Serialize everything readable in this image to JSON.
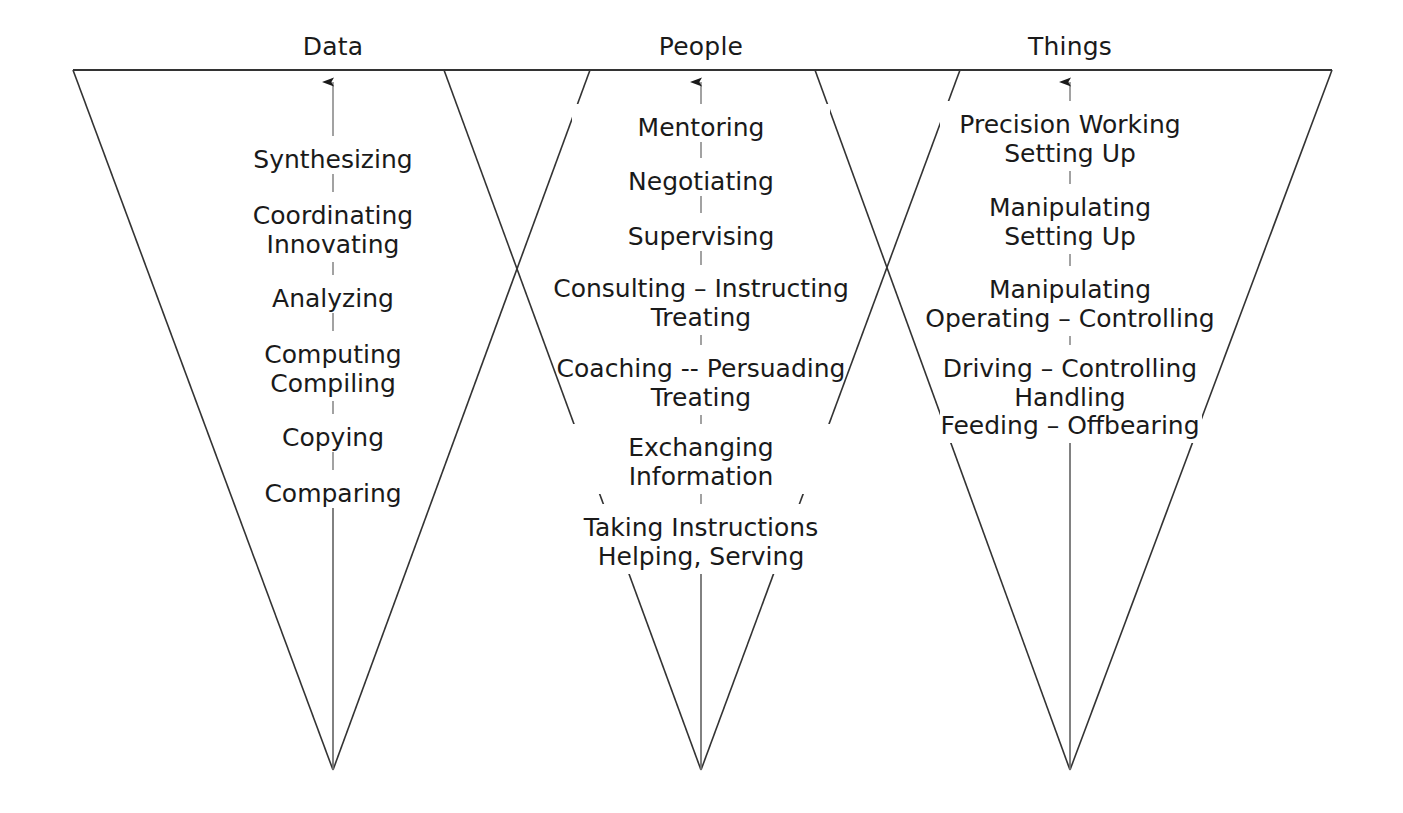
{
  "diagram": {
    "title_visible": false,
    "stroke_color": "#333333",
    "text_color": "#1a1a1a",
    "background": "#ffffff",
    "columns": [
      {
        "id": "data",
        "header": "Data",
        "header_x": 333,
        "header_y": 32,
        "axis_x": 333,
        "arrow_top_y": 82,
        "apex_x": 333,
        "apex_y": 770,
        "triangle": {
          "left_x": 73,
          "right_x": 590,
          "top_y": 70
        },
        "groups": [
          {
            "y": 146,
            "lines": [
              "Synthesizing"
            ]
          },
          {
            "y": 202,
            "lines": [
              "Coordinating",
              "Innovating"
            ]
          },
          {
            "y": 285,
            "lines": [
              "Analyzing"
            ]
          },
          {
            "y": 341,
            "lines": [
              "Computing",
              "Compiling"
            ]
          },
          {
            "y": 424,
            "lines": [
              "Copying"
            ]
          },
          {
            "y": 480,
            "lines": [
              "Comparing"
            ]
          }
        ]
      },
      {
        "id": "people",
        "header": "People",
        "header_x": 701,
        "header_y": 32,
        "axis_x": 701,
        "arrow_top_y": 82,
        "apex_x": 701,
        "apex_y": 770,
        "triangle": {
          "left_x": 444,
          "right_x": 960,
          "top_y": 70
        },
        "groups": [
          {
            "y": 114,
            "lines": [
              "Mentoring"
            ]
          },
          {
            "y": 168,
            "lines": [
              "Negotiating"
            ]
          },
          {
            "y": 223,
            "lines": [
              "Supervising"
            ]
          },
          {
            "y": 275,
            "lines": [
              "Consulting – Instructing",
              "Treating"
            ]
          },
          {
            "y": 355,
            "lines": [
              "Coaching -- Persuading",
              "Treating"
            ]
          },
          {
            "y": 434,
            "lines": [
              "Exchanging",
              "Information"
            ]
          },
          {
            "y": 514,
            "lines": [
              "Taking Instructions",
              "Helping, Serving"
            ]
          }
        ]
      },
      {
        "id": "things",
        "header": "Things",
        "header_x": 1070,
        "header_y": 32,
        "axis_x": 1070,
        "arrow_top_y": 82,
        "apex_x": 1070,
        "apex_y": 770,
        "triangle": {
          "left_x": 815,
          "right_x": 1332,
          "top_y": 70
        },
        "groups": [
          {
            "y": 111,
            "lines": [
              "Precision Working",
              "Setting Up"
            ]
          },
          {
            "y": 194,
            "lines": [
              "Manipulating",
              "Setting Up"
            ]
          },
          {
            "y": 276,
            "lines": [
              "Manipulating",
              "Operating – Controlling"
            ]
          },
          {
            "y": 355,
            "lines": [
              "Driving – Controlling",
              "Handling",
              "Feeding – Offbearing"
            ]
          }
        ]
      }
    ]
  }
}
